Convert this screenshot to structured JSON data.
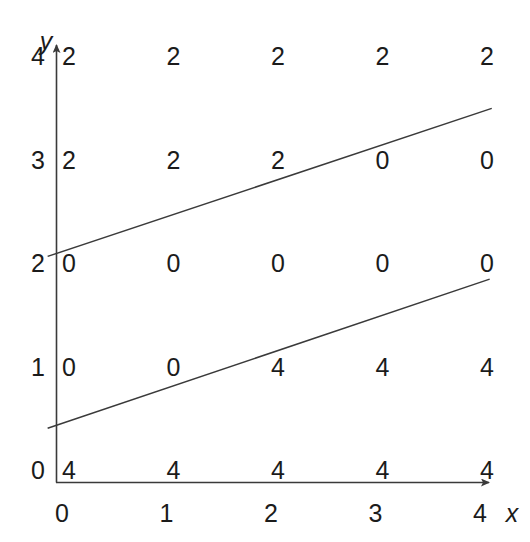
{
  "figure": {
    "background_color": "#ffffff",
    "line_color": "#3a3a3a",
    "text_color": "#1b1b1b"
  },
  "axes": {
    "x_label": "x",
    "y_label": "y",
    "x_ticks": [
      "0",
      "1",
      "2",
      "3",
      "4"
    ],
    "y_ticks": [
      "0",
      "1",
      "2",
      "3",
      "4"
    ]
  },
  "chart_data": {
    "type": "scatter",
    "title": "",
    "xlabel": "x",
    "ylabel": "y",
    "xlim": [
      0,
      4
    ],
    "ylim": [
      0,
      4
    ],
    "grid": false,
    "legend": null,
    "x": [
      0,
      1,
      2,
      3,
      4
    ],
    "y": [
      0,
      1,
      2,
      3,
      4
    ],
    "point_labels": [
      {
        "x": 0,
        "y": 4,
        "label": "2"
      },
      {
        "x": 1,
        "y": 4,
        "label": "2"
      },
      {
        "x": 2,
        "y": 4,
        "label": "2"
      },
      {
        "x": 3,
        "y": 4,
        "label": "2"
      },
      {
        "x": 4,
        "y": 4,
        "label": "2"
      },
      {
        "x": 0,
        "y": 3,
        "label": "2"
      },
      {
        "x": 1,
        "y": 3,
        "label": "2"
      },
      {
        "x": 2,
        "y": 3,
        "label": "2"
      },
      {
        "x": 3,
        "y": 3,
        "label": "0"
      },
      {
        "x": 4,
        "y": 3,
        "label": "0"
      },
      {
        "x": 0,
        "y": 2,
        "label": "0"
      },
      {
        "x": 1,
        "y": 2,
        "label": "0"
      },
      {
        "x": 2,
        "y": 2,
        "label": "0"
      },
      {
        "x": 3,
        "y": 2,
        "label": "0"
      },
      {
        "x": 4,
        "y": 2,
        "label": "0"
      },
      {
        "x": 0,
        "y": 1,
        "label": "0"
      },
      {
        "x": 1,
        "y": 1,
        "label": "0"
      },
      {
        "x": 2,
        "y": 1,
        "label": "4"
      },
      {
        "x": 3,
        "y": 1,
        "label": "4"
      },
      {
        "x": 4,
        "y": 1,
        "label": "4"
      },
      {
        "x": 0,
        "y": 0,
        "label": "4"
      },
      {
        "x": 1,
        "y": 0,
        "label": "4"
      },
      {
        "x": 2,
        "y": 0,
        "label": "4"
      },
      {
        "x": 3,
        "y": 0,
        "label": "4"
      },
      {
        "x": 4,
        "y": 0,
        "label": "4"
      }
    ],
    "lines": [
      {
        "name": "upper-boundary-line",
        "x0": -0.08,
        "y0": 2.18,
        "x1": 4.17,
        "y1": 3.61
      },
      {
        "name": "lower-boundary-line",
        "x0": -0.08,
        "y0": 0.52,
        "x1": 4.15,
        "y1": 1.96
      }
    ]
  }
}
